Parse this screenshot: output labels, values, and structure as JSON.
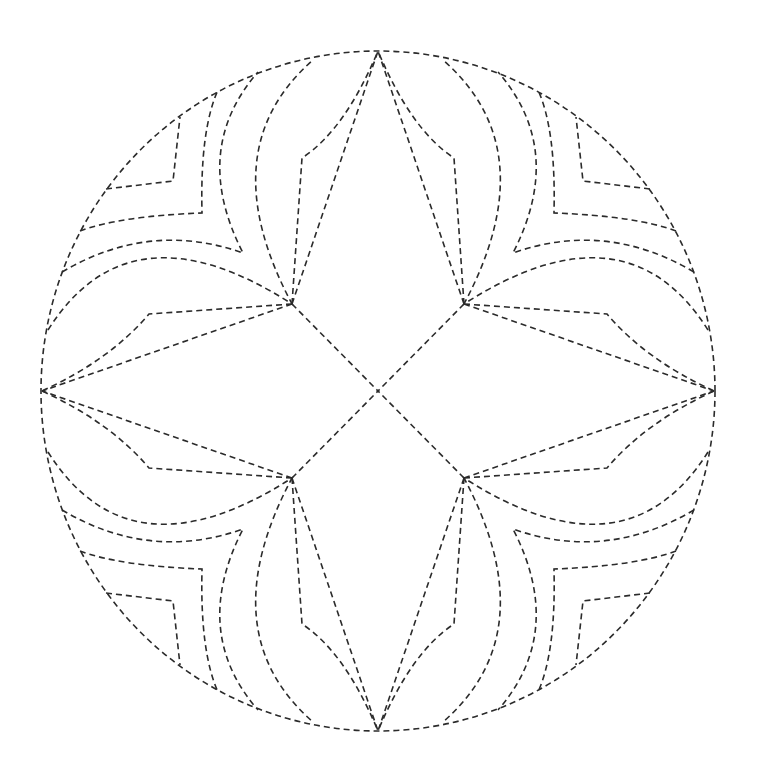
{
  "figure": {
    "stroke_color": "#2b2b2b",
    "background_color": "#ffffff",
    "symmetry": "four-fold mirror (horizontal and vertical)",
    "quadrant_motifs": [
      {
        "name": "inner-angular-chevron",
        "kind": "angular"
      },
      {
        "name": "second-angular-chevron",
        "kind": "angular"
      },
      {
        "name": "third-curved-chevron",
        "kind": "curved"
      },
      {
        "name": "fourth-curved-petal",
        "kind": "curved"
      },
      {
        "name": "star-point-zigzag-horizontal",
        "kind": "angular"
      },
      {
        "name": "star-point-zigzag-vertical",
        "kind": "angular"
      },
      {
        "name": "star-ray-to-top",
        "kind": "straight"
      },
      {
        "name": "star-ray-to-side",
        "kind": "straight"
      },
      {
        "name": "diagonal-to-center",
        "kind": "straight"
      }
    ]
  }
}
